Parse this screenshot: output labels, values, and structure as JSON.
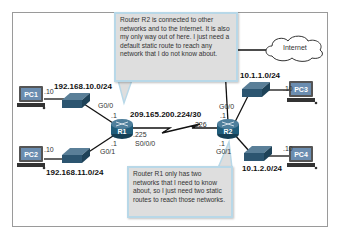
{
  "diagram": {
    "type": "network-topology",
    "devices": {
      "pc1": {
        "label": "PC1",
        "host": ".10"
      },
      "pc2": {
        "label": "PC2",
        "host": ".10"
      },
      "pc3": {
        "label": "PC3",
        "host": ".10"
      },
      "pc4": {
        "label": "PC4",
        "host": ".10"
      },
      "r1": {
        "label": "R1"
      },
      "r2": {
        "label": "R2"
      },
      "internet": {
        "label": "Internet"
      }
    },
    "networks": {
      "r1_lan1": "192.168.10.0/24",
      "r1_lan2": "192.168.11.0/24",
      "r2_lan1": "10.1.1.0/24",
      "r2_lan2": "10.1.2.0/24",
      "serial": "209.165.200.224/30"
    },
    "interfaces": {
      "r1_g00": "G0/0",
      "r1_g00_ip": ".1",
      "r1_g01": "G0/1",
      "r1_g01_ip": ".1",
      "r1_s000": "S0/0/0",
      "r1_s000_ip": ".225",
      "r2_g00": "G0/0",
      "r2_g00_ip": ".1",
      "r2_g01": "G0/1",
      "r2_g01_ip": ".1",
      "r2_serial_ip": ".226"
    },
    "callouts": {
      "r1_thought": "Router R2 is connected to other networks and to the Internet. It is also my only way out of here. I just need a default static route to reach any network that I do not know about.",
      "r2_thought": "Router R1 only has two networks that I need to know about, so I just need two static routes to reach those networks."
    },
    "colors": {
      "router": "#1f5c7a",
      "switch": "#2a6a8a",
      "pc_screen": "#5a89b0",
      "callout_bg": "#dedede",
      "callout_border": "#b8d8e8",
      "link": "#111111",
      "frame": "#9a9a9a"
    }
  }
}
